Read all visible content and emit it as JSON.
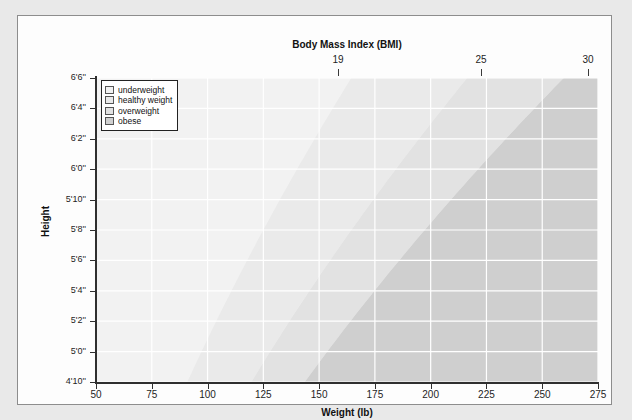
{
  "chart_data": {
    "type": "area",
    "title": "Body Mass Index (BMI)",
    "xlabel": "Weight (lb)",
    "ylabel": "Height",
    "xlim": [
      50,
      275
    ],
    "ylim_inches": [
      58,
      78
    ],
    "grid": true,
    "legend_position": "top-left",
    "x_ticks": [
      50,
      75,
      100,
      125,
      150,
      175,
      200,
      225,
      250,
      275
    ],
    "x_tick_labels": [
      "50",
      "75",
      "100",
      "125",
      "150",
      "175",
      "200",
      "225",
      "250",
      "275"
    ],
    "y_ticks_inches": [
      78,
      76,
      74,
      72,
      70,
      68,
      66,
      64,
      62,
      60,
      58
    ],
    "y_tick_labels": [
      "6'6''",
      "6'4''",
      "6'2''",
      "6'0''",
      "5'10''",
      "5'8''",
      "5'6''",
      "5'4''",
      "5'2''",
      "5'0''",
      "4'10''"
    ],
    "top_axis_label": "Body Mass Index (BMI)",
    "top_ticks_bmi": [
      19,
      25,
      30
    ],
    "top_tick_labels": [
      "19",
      "25",
      "30"
    ],
    "top_tick_x_px": [
      320,
      463,
      570
    ],
    "series": [
      {
        "name": "underweight",
        "bmi_range": [
          0,
          19
        ],
        "color": "#f2f2f2"
      },
      {
        "name": "healthy weight",
        "bmi_range": [
          19,
          25
        ],
        "color": "#eaeaea"
      },
      {
        "name": "overweight",
        "bmi_range": [
          25,
          30
        ],
        "color": "#e2e2e2"
      },
      {
        "name": "obese",
        "bmi_range": [
          30,
          100
        ],
        "color": "#cfcfcf"
      }
    ],
    "boundary_lines_bmi": [
      19,
      25,
      30
    ]
  },
  "legend": {
    "items": [
      {
        "label": "underweight",
        "color": "#f2f2f2"
      },
      {
        "label": "healthy weight",
        "color": "#eaeaea"
      },
      {
        "label": "overweight",
        "color": "#e2e2e2"
      },
      {
        "label": "obese",
        "color": "#cfcfcf"
      }
    ]
  },
  "colors": {
    "page_background": "#e9e9e9",
    "card_background": "#fdfdfd",
    "card_border": "#8d8d8d",
    "plot_background": "#f3f3f3",
    "gridline": "#ffffff",
    "axis": "#2f2f2f",
    "text": "#1d1d1d"
  }
}
